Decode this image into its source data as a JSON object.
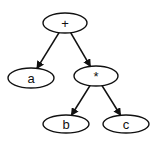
{
  "diagram": {
    "type": "expression-tree",
    "nodes": [
      {
        "id": "plus",
        "label": "+",
        "cx": 65,
        "cy": 23,
        "rx": 22,
        "ry": 10
      },
      {
        "id": "a",
        "label": "a",
        "cx": 31,
        "cy": 78,
        "rx": 23,
        "ry": 10
      },
      {
        "id": "times",
        "label": "*",
        "cx": 96,
        "cy": 76,
        "rx": 22,
        "ry": 10
      },
      {
        "id": "b",
        "label": "b",
        "cx": 66,
        "cy": 124,
        "rx": 23,
        "ry": 9
      },
      {
        "id": "c",
        "label": "c",
        "cx": 126,
        "cy": 124,
        "rx": 23,
        "ry": 9
      }
    ],
    "edges": [
      {
        "from": "plus",
        "to": "a"
      },
      {
        "from": "plus",
        "to": "times"
      },
      {
        "from": "times",
        "to": "b"
      },
      {
        "from": "times",
        "to": "c"
      }
    ],
    "colors": {
      "stroke": "#111111",
      "fill": "#ffffff"
    }
  }
}
